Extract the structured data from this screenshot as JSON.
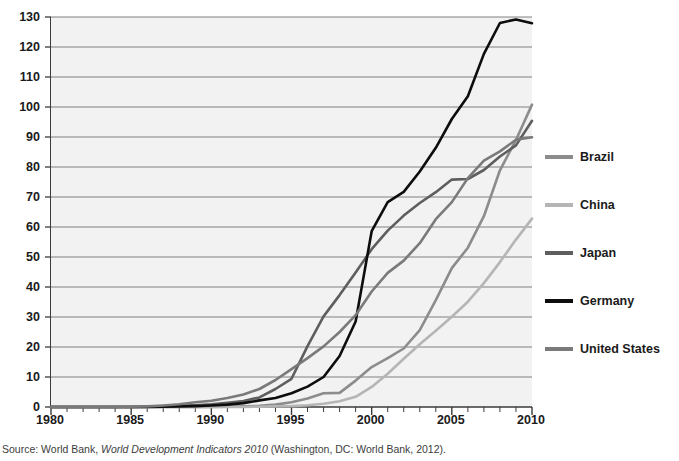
{
  "chart_data": {
    "type": "line",
    "title": "",
    "subtitle": "",
    "xlabel": "",
    "ylabel": "",
    "xlim": [
      1980,
      2010
    ],
    "ylim": [
      0,
      130
    ],
    "x_ticks_major": [
      1980,
      1985,
      1990,
      1995,
      2000,
      2005,
      2010
    ],
    "x_tick_step_minor": 1,
    "y_ticks": [
      0,
      10,
      20,
      30,
      40,
      50,
      60,
      70,
      80,
      90,
      100,
      110,
      120,
      130
    ],
    "grid": "horizontal",
    "legend_position": "right",
    "x": [
      1980,
      1981,
      1982,
      1983,
      1984,
      1985,
      1986,
      1987,
      1988,
      1989,
      1990,
      1991,
      1992,
      1993,
      1994,
      1995,
      1996,
      1997,
      1998,
      1999,
      2000,
      2001,
      2002,
      2003,
      2004,
      2005,
      2006,
      2007,
      2008,
      2009,
      2010
    ],
    "series": [
      {
        "name": "Brazil",
        "color": "#8c8c8c",
        "values": [
          0,
          0,
          0,
          0,
          0,
          0,
          0,
          0,
          0,
          0,
          0,
          0.1,
          0.2,
          0.4,
          0.8,
          1.6,
          2.8,
          4.6,
          4.7,
          8.8,
          13.3,
          16.3,
          19.5,
          25.6,
          35.6,
          46.3,
          53.1,
          63.6,
          78.9,
          89.0,
          100.8
        ],
        "end_value": 103
      },
      {
        "name": "China",
        "color": "#b5b5b5",
        "values": [
          0,
          0,
          0,
          0,
          0,
          0,
          0,
          0,
          0,
          0,
          0,
          0,
          0,
          0.1,
          0.2,
          0.3,
          0.6,
          1.1,
          1.9,
          3.4,
          6.7,
          11.1,
          16.1,
          20.9,
          25.4,
          30.1,
          35.1,
          41.3,
          48.3,
          55.8,
          62.8
        ],
        "end_value": 63
      },
      {
        "name": "Japan",
        "color": "#5e5e5e",
        "values": [
          0,
          0,
          0,
          0,
          0,
          0,
          0.1,
          0.2,
          0.4,
          0.6,
          0.9,
          1.4,
          2.0,
          3.2,
          6.0,
          9.4,
          20.3,
          30.2,
          37.3,
          44.8,
          52.6,
          58.8,
          63.8,
          68.0,
          71.6,
          75.8,
          76.0,
          79.0,
          83.5,
          87.2,
          95.4
        ],
        "end_value": 95
      },
      {
        "name": "Germany",
        "color": "#0d0d0d",
        "values": [
          0,
          0,
          0,
          0,
          0,
          0,
          0,
          0.1,
          0.2,
          0.3,
          0.5,
          0.8,
          1.3,
          2.2,
          3.0,
          4.6,
          6.8,
          10.0,
          17.0,
          28.5,
          58.6,
          68.3,
          71.7,
          78.5,
          86.4,
          96.0,
          103.6,
          117.7,
          128.0,
          129.2,
          127.9
        ],
        "end_value": 128
      },
      {
        "name": "United States",
        "color": "#7a7a7a",
        "values": [
          0,
          0,
          0,
          0,
          0,
          0.1,
          0.2,
          0.5,
          0.9,
          1.6,
          2.1,
          3.0,
          4.2,
          6.0,
          9.0,
          12.6,
          16.3,
          20.2,
          25.0,
          30.6,
          38.5,
          44.7,
          48.8,
          54.6,
          62.6,
          68.3,
          76.3,
          82.1,
          85.2,
          89.1,
          89.9
        ],
        "end_value": 90
      }
    ]
  },
  "axes": {
    "y_tick_labels": [
      "130",
      "120",
      "110",
      "100",
      "90",
      "80",
      "70",
      "60",
      "50",
      "40",
      "30",
      "20",
      "10",
      "0"
    ],
    "x_tick_labels": [
      "1980",
      "1985",
      "1990",
      "1995",
      "2000",
      "2005",
      "2010"
    ]
  },
  "legend": {
    "items": [
      {
        "label": "Brazil",
        "color": "#8c8c8c"
      },
      {
        "label": "China",
        "color": "#b5b5b5"
      },
      {
        "label": "Japan",
        "color": "#5e5e5e"
      },
      {
        "label": "Germany",
        "color": "#0d0d0d"
      },
      {
        "label": "United States",
        "color": "#7a7a7a"
      }
    ]
  },
  "source": {
    "prefix": "Source: World Bank, ",
    "title": "World Development Indicators 2010",
    "suffix": " (Washington, DC: World Bank, 2012)."
  },
  "colors": {
    "plot_background": "#f2f2f2",
    "gridline": "#808080",
    "axis": "#3a3a3a",
    "text": "#1a1a1a"
  }
}
